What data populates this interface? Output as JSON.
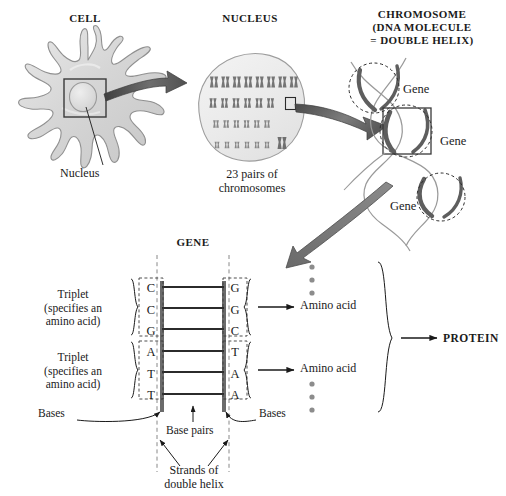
{
  "diagram": {
    "title_cell": "CELL",
    "title_nucleus": "NUCLEUS",
    "title_chromosome_line1": "CHROMOSOME",
    "title_chromosome_line2": "(DNA MOLECULE",
    "title_chromosome_line3": "= DOUBLE HELIX)",
    "title_gene": "GENE"
  },
  "cell": {
    "nucleus_label": "Nucleus"
  },
  "nucleus": {
    "caption_line1": "23 pairs of",
    "caption_line2": "chromosomes",
    "rows": [
      8,
      6,
      6,
      6
    ]
  },
  "chromosome": {
    "gene_label_1": "Gene",
    "gene_label_2": "Gene",
    "gene_label_3": "Gene"
  },
  "gene": {
    "triplet_label_line1": "Triplet",
    "triplet_label_line2": "(specifies an",
    "triplet_label_line3": "amino acid)",
    "bases_label_left": "Bases",
    "bases_label_right": "Bases",
    "base_pairs_label": "Base pairs",
    "strands_label_line1": "Strands of",
    "strands_label_line2": "double helix",
    "triplets": [
      {
        "left": [
          "C",
          "C",
          "G"
        ],
        "right": [
          "G",
          "G",
          "C"
        ],
        "product": "Amino acid"
      },
      {
        "left": [
          "A",
          "T",
          "T"
        ],
        "right": [
          "T",
          "A",
          "A"
        ],
        "product": "Amino acid"
      }
    ],
    "protein_label": "PROTEIN"
  },
  "colors": {
    "ink": "#1a1a1a",
    "cell_fill": "#d9d9d9",
    "cell_stroke": "#8c8c8c",
    "arrow_dark": "#4d4d4d",
    "arrow_light": "#a6a6a6",
    "helix_thick": "#595959",
    "helix_thin": "#9a9a9a",
    "rung": "#2b2b2b",
    "strand_bar": "#6b6b6b",
    "dot": "#8c8c8c"
  }
}
